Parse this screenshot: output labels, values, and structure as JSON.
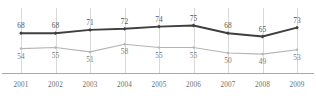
{
  "chart_data": {
    "type": "line",
    "title": "",
    "subtitle": "",
    "xlabel": "",
    "ylabel": "",
    "grid": "vertical",
    "legend": "none",
    "categories": [
      "2001",
      "2002",
      "2003",
      "2004",
      "2005",
      "2006",
      "2007",
      "2008",
      "2009"
    ],
    "ylim": [
      40,
      80
    ],
    "series": [
      {
        "name": "upper-series",
        "color": "#3f3f3f",
        "marker": "diamond",
        "label_position": "above",
        "values": [
          68,
          68,
          71,
          72,
          74,
          75,
          68,
          65,
          73
        ]
      },
      {
        "name": "lower-series",
        "color": "#b4b4b4",
        "marker": "diamond",
        "label_position": "below",
        "values": [
          54,
          55,
          51,
          58,
          55,
          55,
          50,
          49,
          53
        ]
      }
    ]
  },
  "axis": {
    "tick_labels": [
      "2001",
      "2002",
      "2003",
      "2004",
      "2005",
      "2006",
      "2007",
      "2008",
      "2009"
    ],
    "axis_line_color": "#a9a9a9",
    "gridline_color": "#cfcfcf"
  },
  "upper_value_labels": [
    "68",
    "68",
    "71",
    "72",
    "74",
    "75",
    "68",
    "65",
    "73"
  ],
  "lower_value_labels": [
    "54",
    "55",
    "51",
    "58",
    "55",
    "55",
    "50",
    "49",
    "53"
  ]
}
